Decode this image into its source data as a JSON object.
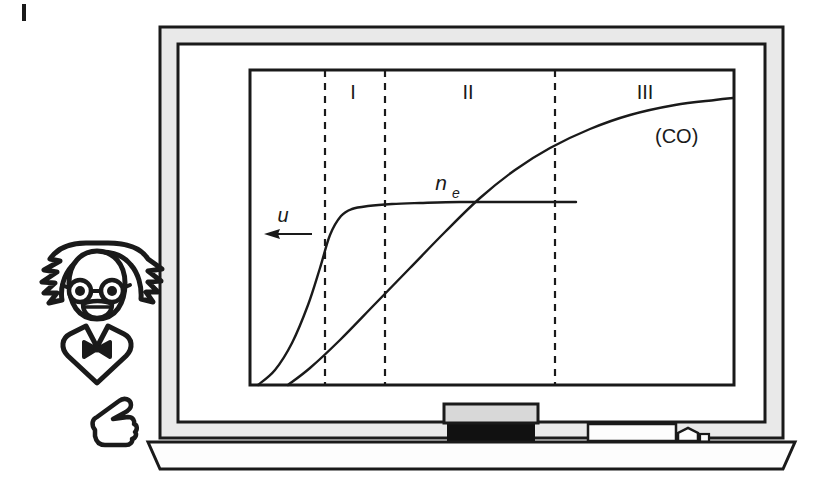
{
  "figure": {
    "kind": "blackboard-illustration",
    "caption_marker": "|",
    "background_color": "#ffffff",
    "ink_color": "#1a1a1a",
    "frame_fill": "#e8e8e8",
    "board_fill": "#ffffff",
    "eraser_top_color": "#d8d8d8",
    "eraser_felt_color": "#111111",
    "chalk_color": "#fcfcfc"
  },
  "board": {
    "name": "chalkboard",
    "outer_frame": {
      "x": 160,
      "y": 27,
      "w": 623,
      "h": 411
    },
    "inner_frame": {
      "x": 178,
      "y": 44,
      "w": 587,
      "h": 378
    },
    "tray": {
      "x": 148,
      "y": 438,
      "w": 647,
      "h": 24
    }
  },
  "tray_items": [
    {
      "name": "eraser",
      "label": "eraser",
      "x": 444,
      "y": 404,
      "w": 92,
      "h": 34
    },
    {
      "name": "chalk-stick-long",
      "label": "chalk",
      "x": 588,
      "y": 424,
      "w": 86,
      "h": 16
    },
    {
      "name": "chalk-stick-short",
      "label": "chalk",
      "x": 676,
      "y": 428,
      "w": 24,
      "h": 13
    }
  ],
  "character": {
    "name": "puzzled-scientist",
    "description": "cartoon scientist with wild hair, round glasses, open mouth and bow tie, pointing at the board",
    "parts": [
      "hair",
      "face",
      "glasses",
      "mouth",
      "collar",
      "bow-tie",
      "pointing-hand"
    ]
  },
  "chart_data": {
    "type": "line",
    "title": "",
    "xlabel": "",
    "ylabel": "",
    "grid": false,
    "legend": "inline-annotations",
    "plot_frame": {
      "x": 250,
      "y": 70,
      "w": 484,
      "h": 315
    },
    "xlim": [
      0,
      1
    ],
    "ylim": [
      0,
      1
    ],
    "zone_dividers": [
      {
        "label": "",
        "x_px": 325
      },
      {
        "label": "",
        "x_px": 385
      },
      {
        "label": "",
        "x_px": 555
      }
    ],
    "zone_labels": [
      {
        "text": "I",
        "x_px": 353,
        "y_px": 92
      },
      {
        "text": "II",
        "x_px": 468,
        "y_px": 92
      },
      {
        "text": "III",
        "x_px": 645,
        "y_px": 92
      }
    ],
    "series": [
      {
        "name": "n_e",
        "label": "n",
        "sublabel": "e",
        "label_x_px": 441,
        "label_y_px": 190,
        "style": "solid",
        "description": "electron density: steep rise through zone I then saturating plateau",
        "points_px": [
          [
            258,
            385
          ],
          [
            275,
            370
          ],
          [
            292,
            343
          ],
          [
            308,
            305
          ],
          [
            320,
            268
          ],
          [
            330,
            235
          ],
          [
            341,
            216
          ],
          [
            352,
            209
          ],
          [
            368,
            206
          ],
          [
            392,
            204
          ],
          [
            420,
            203
          ],
          [
            460,
            202
          ],
          [
            510,
            202
          ],
          [
            576,
            202
          ]
        ]
      },
      {
        "name": "CO",
        "label": "(CO)",
        "label_x_px": 655,
        "label_y_px": 143,
        "style": "solid",
        "description": "CO concentration: near-linear rise through zone II, saturating across zone III",
        "points_px": [
          [
            288,
            385
          ],
          [
            310,
            368
          ],
          [
            340,
            340
          ],
          [
            375,
            304
          ],
          [
            410,
            268
          ],
          [
            445,
            232
          ],
          [
            480,
            198
          ],
          [
            515,
            170
          ],
          [
            550,
            148
          ],
          [
            590,
            129
          ],
          [
            630,
            115
          ],
          [
            675,
            105
          ],
          [
            715,
            100
          ],
          [
            733,
            98
          ]
        ]
      }
    ],
    "annotations": [
      {
        "name": "flow-velocity-arrow",
        "text": "u",
        "text_x_px": 283,
        "text_y_px": 215,
        "arrow_from_px": [
          312,
          234
        ],
        "arrow_to_px": [
          266,
          234
        ],
        "direction": "left"
      }
    ]
  }
}
